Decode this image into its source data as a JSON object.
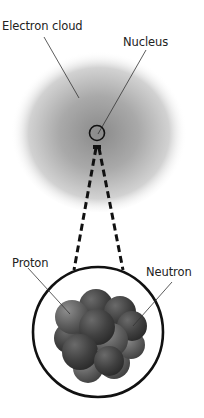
{
  "diagram": {
    "labels": {
      "electron_cloud": "Electron cloud",
      "nucleus": "Nucleus",
      "proton": "Proton",
      "neutron": "Neutron"
    },
    "colors": {
      "cloud_center": "#8a8a8a",
      "cloud_edge": "#f2f2f2",
      "line": "#222222",
      "particle_dark": "#3e3e3e",
      "particle_light": "#6a6a6a"
    }
  }
}
